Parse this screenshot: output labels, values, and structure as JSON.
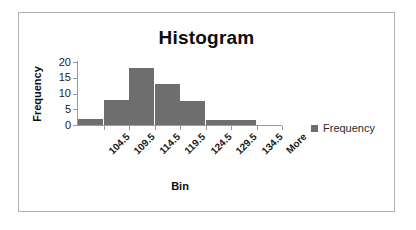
{
  "chart_data": {
    "type": "bar",
    "title": "Histogram",
    "xlabel": "Bin",
    "ylabel": "Frequency",
    "categories": [
      "104.5",
      "109.5",
      "114.5",
      "119.5",
      "124.5",
      "129.5",
      "134.5",
      "More"
    ],
    "values": [
      2,
      8,
      18,
      13,
      7.5,
      1.5,
      1.5,
      0
    ],
    "series": [
      {
        "name": "Frequency",
        "values": [
          2,
          8,
          18,
          13,
          7.5,
          1.5,
          1.5,
          0
        ]
      }
    ],
    "ylim": [
      0,
      20
    ],
    "yticks": [
      20,
      15,
      10,
      5,
      0
    ],
    "grid": false,
    "legend": {
      "position": "right",
      "entries": [
        "Frequency"
      ]
    },
    "bar_color": "#6e6e6e",
    "axis_color": "#9a9a9a",
    "text_color": "#1a1a1a",
    "frame_color": "#b0b0b0",
    "background": "#ffffff"
  },
  "legend": {
    "frequency_label": "Frequency"
  }
}
